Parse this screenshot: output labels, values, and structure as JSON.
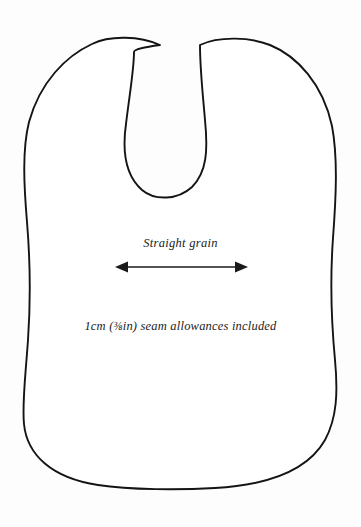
{
  "document": {
    "type": "sewing-pattern-piece",
    "piece_name": "Bib front",
    "background_color": "#fdfdfd",
    "outline_color": "#141414",
    "fill_color": "#ffffff"
  },
  "annotations": {
    "grain_label": "Straight grain",
    "grain_arrow": {
      "name": "double-headed-arrow",
      "direction": "horizontal",
      "x_start": 115,
      "x_end": 248,
      "y": 267,
      "color": "#1a1a1a"
    },
    "seam_allowance_note": {
      "prefix": "1cm (",
      "fraction": "⅜",
      "unit": "in",
      "suffix": ") seam allowances included",
      "full_text": "1cm (⅜in) seam allowances included"
    }
  }
}
